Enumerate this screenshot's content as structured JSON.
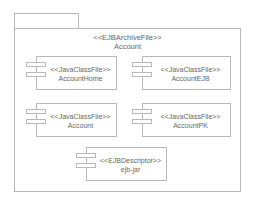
{
  "package": {
    "stereotype": "<<EJBArchiveFile>>",
    "name": "Account"
  },
  "components": [
    {
      "stereotype": "<<JavaClassFile>>",
      "name": "AccountHome"
    },
    {
      "stereotype": "<<JavaClassFile>>",
      "name": "AccountEJB"
    },
    {
      "stereotype": "<<JavaClassFile>>",
      "name": "Account"
    },
    {
      "stereotype": "<<JavaClassFile>>",
      "name": "AccountPK"
    },
    {
      "stereotype": "<<EJBDescriptor>>",
      "name": "ejb-jar"
    }
  ]
}
